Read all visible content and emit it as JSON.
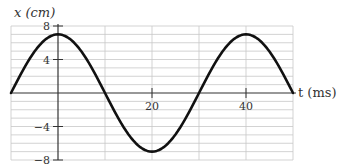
{
  "chart_data": {
    "type": "line",
    "title": "",
    "xlabel": "t (ms)",
    "ylabel": "x (cm)",
    "xlim": [
      -10,
      50
    ],
    "ylim": [
      -8,
      8
    ],
    "x_ticks": [
      20,
      40
    ],
    "x_tick_labels": [
      "20",
      "40"
    ],
    "y_ticks": [
      8,
      4,
      -4,
      -8
    ],
    "y_tick_labels": [
      "8",
      "4",
      "−4",
      "−8"
    ],
    "grid": true,
    "legend": null,
    "series": [
      {
        "name": "x(t) = 7 cos(2πt/40)",
        "amplitude": 7,
        "period": 40,
        "x": [
          -10,
          -5,
          0,
          5,
          10,
          15,
          20,
          25,
          30,
          35,
          40,
          45,
          50
        ],
        "values": [
          0,
          4.95,
          7,
          4.95,
          0,
          -4.95,
          -7,
          -4.95,
          0,
          4.95,
          7,
          4.95,
          0
        ]
      }
    ]
  },
  "labels": {
    "y_axis": "x (cm)",
    "x_axis": "t (ms)"
  },
  "colors": {
    "curve": "#111111",
    "axis": "#333333",
    "grid": "#c8c8c8"
  }
}
